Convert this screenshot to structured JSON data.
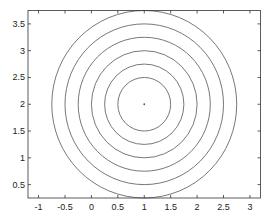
{
  "chart_data": {
    "type": "line",
    "title": "",
    "xlabel": "",
    "ylabel": "",
    "xlim": [
      -1.2,
      3.2
    ],
    "ylim": [
      0.25,
      3.75
    ],
    "xticks": [
      -1,
      -0.5,
      0,
      0.5,
      1,
      1.5,
      2,
      2.5,
      3
    ],
    "xtick_labels": [
      "-1",
      "-0.5",
      "0",
      "0.5",
      "1",
      "1.5",
      "2",
      "2.5",
      "3"
    ],
    "yticks": [
      0.5,
      1,
      1.5,
      2,
      2.5,
      3,
      3.5
    ],
    "ytick_labels": [
      "0.5",
      "1",
      "1.5",
      "2",
      "2.5",
      "3",
      "3.5"
    ],
    "grid": false,
    "legend": "none",
    "center": {
      "x": 1,
      "y": 2
    },
    "series": [
      {
        "name": "circle-r0.5",
        "shape": "circle",
        "cx": 1,
        "cy": 2,
        "r": 0.5
      },
      {
        "name": "circle-r0.75",
        "shape": "circle",
        "cx": 1,
        "cy": 2,
        "r": 0.75
      },
      {
        "name": "circle-r1.0",
        "shape": "circle",
        "cx": 1,
        "cy": 2,
        "r": 1.0
      },
      {
        "name": "circle-r1.25",
        "shape": "circle",
        "cx": 1,
        "cy": 2,
        "r": 1.25
      },
      {
        "name": "circle-r1.5",
        "shape": "circle",
        "cx": 1,
        "cy": 2,
        "r": 1.5
      },
      {
        "name": "circle-r1.75",
        "shape": "circle",
        "cx": 1,
        "cy": 2,
        "r": 1.75
      }
    ],
    "colors": {
      "line": "#555555",
      "axes": "#333333",
      "center_point": "#555555"
    }
  }
}
